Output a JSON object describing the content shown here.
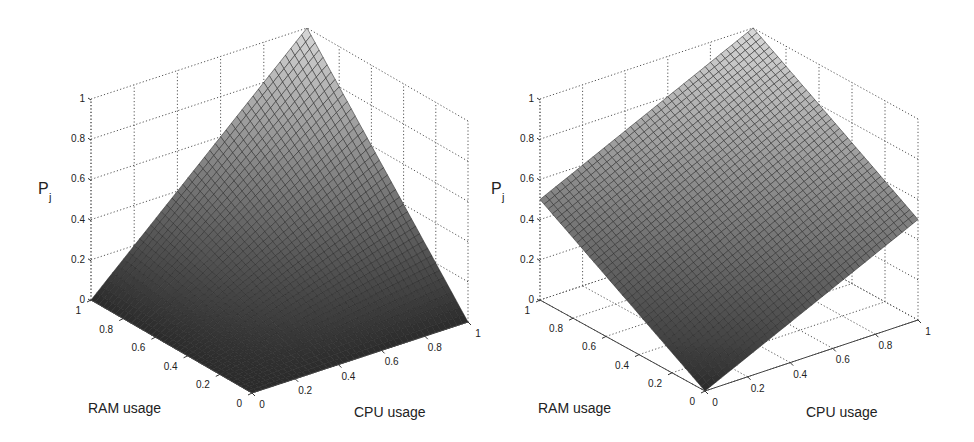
{
  "chart_data": [
    {
      "type": "surface3d",
      "title": "",
      "function": "P_j = CPU usage × RAM usage",
      "xlabel": "CPU usage",
      "ylabel": "RAM usage",
      "zlabel": "P_j",
      "xlim": [
        0,
        1
      ],
      "ylim": [
        0,
        1
      ],
      "zlim": [
        0,
        1
      ],
      "x_ticks": [
        "0",
        "0.2",
        "0.4",
        "0.6",
        "0.8",
        "1"
      ],
      "y_ticks": [
        "0",
        "0.2",
        "0.4",
        "0.6",
        "0.8",
        "1"
      ],
      "z_ticks": [
        "0",
        "0.2",
        "0.4",
        "0.6",
        "0.8",
        "1"
      ],
      "grid": true,
      "corner_values": {
        "cpu0_ram0": 0,
        "cpu1_ram0": 0,
        "cpu0_ram1": 0,
        "cpu1_ram1": 1
      },
      "colormap": "gray"
    },
    {
      "type": "surface3d",
      "title": "",
      "function": "P_j = (CPU usage + RAM usage) / 2",
      "xlabel": "CPU usage",
      "ylabel": "RAM usage",
      "zlabel": "P_j",
      "xlim": [
        0,
        1
      ],
      "ylim": [
        0,
        1
      ],
      "zlim": [
        0,
        1
      ],
      "x_ticks": [
        "0",
        "0.2",
        "0.4",
        "0.6",
        "0.8",
        "1"
      ],
      "y_ticks": [
        "0",
        "0.2",
        "0.4",
        "0.6",
        "0.8",
        "1"
      ],
      "z_ticks": [
        "0",
        "0.2",
        "0.4",
        "0.6",
        "0.8",
        "1"
      ],
      "grid": true,
      "corner_values": {
        "cpu0_ram0": 0,
        "cpu1_ram0": 0.5,
        "cpu0_ram1": 0.5,
        "cpu1_ram1": 1
      },
      "colormap": "gray"
    }
  ],
  "plots": [
    {
      "zlabel_main": "P",
      "zlabel_sub": "j",
      "xlabel": "CPU usage",
      "ylabel": "RAM usage",
      "ticks": [
        "0",
        "0.2",
        "0.4",
        "0.6",
        "0.8",
        "1"
      ],
      "proj": {
        "ox": 252,
        "oy": 393,
        "rx": -161,
        "ry": -93,
        "cx": 216,
        "cy": -71,
        "zh": 201
      },
      "surface": "product"
    },
    {
      "zlabel_main": "P",
      "zlabel_sub": "j",
      "xlabel": "CPU usage",
      "ylabel": "RAM usage",
      "ticks": [
        "0",
        "0.2",
        "0.4",
        "0.6",
        "0.8",
        "1"
      ],
      "proj": {
        "ox": 705,
        "oy": 391,
        "rx": -165,
        "ry": -91,
        "cx": 213,
        "cy": -71,
        "zh": 201
      },
      "surface": "mean"
    }
  ],
  "colors": {
    "mesh_line": "#2a2a2a",
    "grid": "#555555",
    "surface_low": "#2b2b2b",
    "surface_high": "#d8d8d8"
  },
  "mesh_divisions": 40
}
